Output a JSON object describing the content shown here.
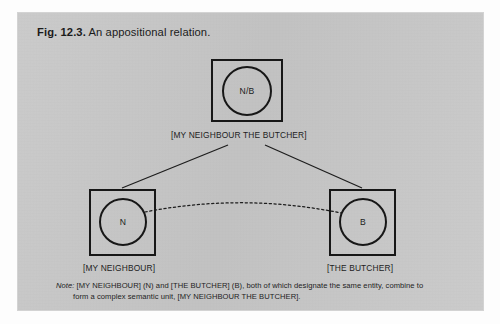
{
  "figure": {
    "number_label": "Fig. 12.3.",
    "caption": "An appositional relation."
  },
  "diagram": {
    "type": "cognitive-grammar-apposition",
    "nodes": [
      {
        "id": "composite",
        "symbol": "N/B",
        "label": "[MY NEIGHBOUR THE BUTCHER]",
        "position": "top-center"
      },
      {
        "id": "neighbour",
        "symbol": "N",
        "label": "[MY NEIGHBOUR]",
        "position": "bottom-left"
      },
      {
        "id": "butcher",
        "symbol": "B",
        "label": "[THE BUTCHER]",
        "position": "bottom-right"
      }
    ],
    "connectors": [
      {
        "id": "composite-to-neighbour",
        "from": "composite",
        "to": "neighbour",
        "style": "solid"
      },
      {
        "id": "composite-to-butcher",
        "from": "composite",
        "to": "butcher",
        "style": "solid"
      },
      {
        "id": "neighbour-to-butcher",
        "from": "neighbour",
        "to": "butcher",
        "style": "dashed-arc"
      }
    ],
    "colors": {
      "ink": "#171717",
      "page": "#c8c8c8"
    }
  },
  "note": {
    "word": "Note:",
    "line1": "[MY NEIGHBOUR] (N) and [THE BUTCHER]  (B), both of which designate the same entity, combine to",
    "line2": "form a complex semantic unit, [MY NEIGHBOUR THE BUTCHER]."
  }
}
